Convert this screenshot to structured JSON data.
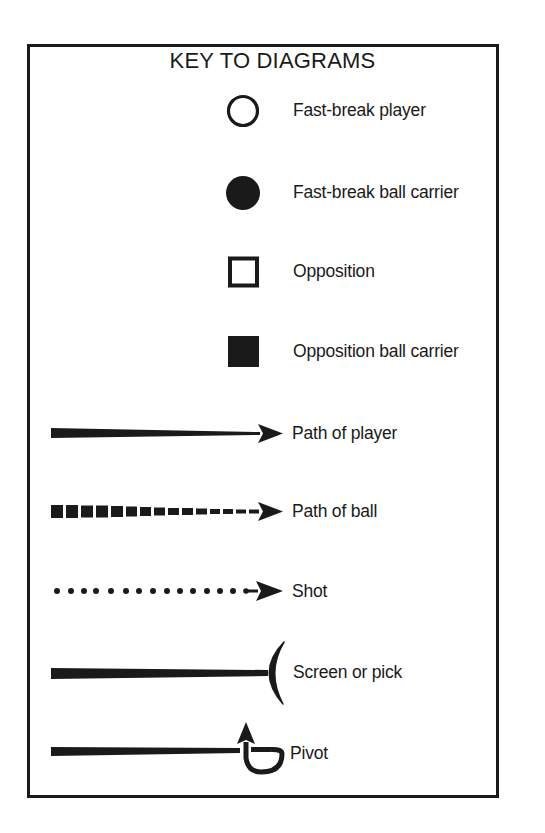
{
  "title": "KEY TO DIAGRAMS",
  "colors": {
    "ink": "#1a1a1a",
    "background": "#ffffff"
  },
  "legend": [
    {
      "symbol": "open-circle",
      "label": "Fast-break player"
    },
    {
      "symbol": "filled-circle",
      "label": "Fast-break ball carrier"
    },
    {
      "symbol": "open-square",
      "label": "Opposition"
    },
    {
      "symbol": "filled-square",
      "label": "Opposition ball carrier"
    },
    {
      "symbol": "solid-tapered-arrow",
      "label": "Path of player"
    },
    {
      "symbol": "dashed-tapered-arrow",
      "label": "Path of ball"
    },
    {
      "symbol": "dotted-arrow",
      "label": "Shot"
    },
    {
      "symbol": "line-with-arc",
      "label": "Screen or pick"
    },
    {
      "symbol": "line-with-loop-arrow",
      "label": "Pivot"
    }
  ]
}
